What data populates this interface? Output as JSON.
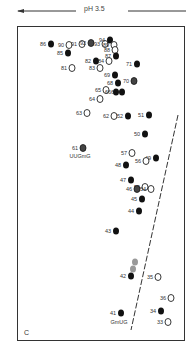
{
  "header": {
    "direction_label": "pH 3.5",
    "arrow_direction": "left"
  },
  "panel_label": "C",
  "annotations": {
    "uugmg": "UUGmG",
    "gmug": "GmUG"
  },
  "spots": [
    {
      "id": "86",
      "x": 51,
      "y": 44,
      "filled": true
    },
    {
      "id": "90",
      "x": 69,
      "y": 45,
      "filled": false
    },
    {
      "id": "91",
      "x": 82,
      "y": 44,
      "filled": false
    },
    {
      "id": "92",
      "x": 91,
      "y": 43,
      "filled": "half"
    },
    {
      "id": "93",
      "x": 105,
      "y": 44,
      "filled": false
    },
    {
      "id": "94",
      "x": 110,
      "y": 40,
      "filled": true
    },
    {
      "id": "89",
      "x": 114,
      "y": 45,
      "filled": false
    },
    {
      "id": "88",
      "x": 115,
      "y": 50,
      "filled": false
    },
    {
      "id": "87",
      "x": 116,
      "y": 56,
      "filled": true
    },
    {
      "id": "85",
      "x": 68,
      "y": 53,
      "filled": true
    },
    {
      "id": "82",
      "x": 96,
      "y": 61,
      "filled": true
    },
    {
      "id": "84",
      "x": 109,
      "y": 61,
      "filled": false
    },
    {
      "id": "71",
      "x": 137,
      "y": 64,
      "filled": true
    },
    {
      "id": "81",
      "x": 72,
      "y": 68,
      "filled": false
    },
    {
      "id": "83",
      "x": 100,
      "y": 68,
      "filled": false
    },
    {
      "id": "69",
      "x": 115,
      "y": 75,
      "filled": true
    },
    {
      "id": "68",
      "x": 118,
      "y": 83,
      "filled": true
    },
    {
      "id": "70",
      "x": 134,
      "y": 81,
      "filled": "half"
    },
    {
      "id": "65",
      "x": 106,
      "y": 90,
      "filled": false
    },
    {
      "id": "67",
      "x": 122,
      "y": 92,
      "filled": true
    },
    {
      "id": "66",
      "x": 116,
      "y": 92,
      "filled": true
    },
    {
      "id": "64",
      "x": 100,
      "y": 99,
      "filled": false
    },
    {
      "id": "63",
      "x": 87,
      "y": 113,
      "filled": false
    },
    {
      "id": "62",
      "x": 114,
      "y": 116,
      "filled": false
    },
    {
      "id": "52",
      "x": 128,
      "y": 116,
      "filled": true
    },
    {
      "id": "51",
      "x": 149,
      "y": 115,
      "filled": true
    },
    {
      "id": "50",
      "x": 145,
      "y": 134,
      "filled": true
    },
    {
      "id": "61",
      "x": 83,
      "y": 148,
      "filled": "half"
    },
    {
      "id": "57",
      "x": 132,
      "y": 153,
      "filled": false
    },
    {
      "id": "49",
      "x": 156,
      "y": 158,
      "filled": true
    },
    {
      "id": "56",
      "x": 146,
      "y": 161,
      "filled": false
    },
    {
      "id": "48",
      "x": 126,
      "y": 165,
      "filled": true
    },
    {
      "id": "47",
      "x": 131,
      "y": 180,
      "filled": true
    },
    {
      "id": "55",
      "x": 145,
      "y": 187,
      "filled": false
    },
    {
      "id": "46",
      "x": 137,
      "y": 189,
      "filled": "half"
    },
    {
      "id": "54",
      "x": 151,
      "y": 189,
      "filled": false
    },
    {
      "id": "45",
      "x": 142,
      "y": 199,
      "filled": true
    },
    {
      "id": "44",
      "x": 139,
      "y": 211,
      "filled": true
    },
    {
      "id": "43",
      "x": 116,
      "y": 231,
      "filled": true
    },
    {
      "id": "42g1",
      "x": 135,
      "y": 262,
      "filled": "grey",
      "label": ""
    },
    {
      "id": "42g2",
      "x": 133,
      "y": 269,
      "filled": "grey",
      "label": ""
    },
    {
      "id": "42",
      "x": 131,
      "y": 276,
      "filled": true
    },
    {
      "id": "35",
      "x": 158,
      "y": 277,
      "filled": false
    },
    {
      "id": "36",
      "x": 171,
      "y": 298,
      "filled": false
    },
    {
      "id": "41",
      "x": 121,
      "y": 313,
      "filled": true
    },
    {
      "id": "34",
      "x": 161,
      "y": 311,
      "filled": true
    },
    {
      "id": "33",
      "x": 168,
      "y": 322,
      "filled": false
    }
  ],
  "dashed_line": {
    "x1": 178,
    "y1": 115,
    "x2": 131,
    "y2": 330
  }
}
